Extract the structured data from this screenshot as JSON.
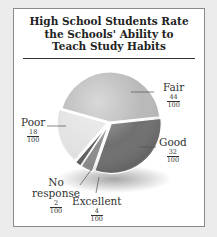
{
  "chart_data": {
    "type": "pie",
    "title": "High School Students Rate the Schools' Ability to Teach Study Habits",
    "title_lines": [
      "High School Students Rate",
      "the Schools' Ability to",
      "Teach Study Habits"
    ],
    "categories": [
      "Fair",
      "Good",
      "Excellent",
      "No response",
      "Poor"
    ],
    "values": [
      44,
      32,
      4,
      2,
      18
    ],
    "labels": [
      {
        "name": "Fair",
        "numerator": "44",
        "denominator": "100",
        "color": "#b9b9b9"
      },
      {
        "name": "Good",
        "numerator": "32",
        "denominator": "100",
        "color": "#6f6f6f"
      },
      {
        "name": "Excellent",
        "numerator": "4",
        "denominator": "100",
        "color": "#8c8c8c"
      },
      {
        "name": "No response",
        "name_lines": [
          "No",
          "response"
        ],
        "numerator": "2",
        "denominator": "100",
        "color": "#5e5e5e"
      },
      {
        "name": "Poor",
        "numerator": "18",
        "denominator": "100",
        "color": "#e3e3e3"
      }
    ],
    "units": "fraction of 100",
    "legend": "none (callout labels)"
  }
}
